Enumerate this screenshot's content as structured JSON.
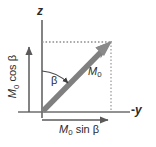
{
  "figure": {
    "background_color": "#ffffff",
    "axis_color": "#6e6e6e",
    "vector_color": "#808080",
    "dotted_color": "#9a9a9a",
    "text_color": "#2b2b2b"
  },
  "labels": {
    "z_axis": "z",
    "y_axis_prefix": "-",
    "y_axis": "y",
    "vector_m": "M",
    "vector_sub": "0",
    "angle": "β",
    "sin_component_m": "M",
    "sin_component_sub": "0",
    "sin_component_fn": " sin β",
    "cos_component_m": "M",
    "cos_component_sub": "0",
    "cos_component_fn": " cos β"
  },
  "geometry": {
    "origin_x": 42,
    "origin_y": 112,
    "z_axis_top_y": 20,
    "y_axis_left_x": 18,
    "y_axis_right_x": 131,
    "vector_tip_x": 111,
    "vector_tip_y": 42,
    "projection_x": 111,
    "projection_y": 42,
    "cos_arrow_x": 29,
    "cos_arrow_top_y": 45,
    "sin_arrow_y": 120,
    "sin_arrow_end_x": 111,
    "angle_degrees": 46
  }
}
